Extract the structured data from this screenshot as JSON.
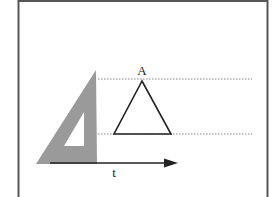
{
  "diagram": {
    "type": "geometry-construction",
    "labels": {
      "vertex": "A",
      "axis": "t"
    },
    "colors": {
      "frame": "#555555",
      "set_square_fill": "#9a9a9a",
      "set_square_cutout": "#ffffff",
      "triangle_stroke": "#222222",
      "dotted_line": "#888888",
      "arrow": "#222222",
      "background": "#ffffff"
    },
    "frame": {
      "left": 18,
      "right": 268,
      "top": 0,
      "bottom_open": true
    },
    "set_square": {
      "outer": [
        [
          96,
          70
        ],
        [
          36,
          164
        ],
        [
          97,
          164
        ]
      ],
      "cutout": [
        [
          84,
          112
        ],
        [
          64,
          146
        ],
        [
          84,
          146
        ]
      ]
    },
    "triangle_A": {
      "apex": [
        142,
        81
      ],
      "base_left": [
        114,
        134
      ],
      "base_right": [
        171,
        134
      ]
    },
    "guide_lines": [
      {
        "y": 79,
        "x1": 98,
        "x2": 252
      },
      {
        "y": 134,
        "x1": 98,
        "x2": 252
      }
    ],
    "arrow_t": {
      "y": 163,
      "x1": 50,
      "x2": 178
    }
  }
}
